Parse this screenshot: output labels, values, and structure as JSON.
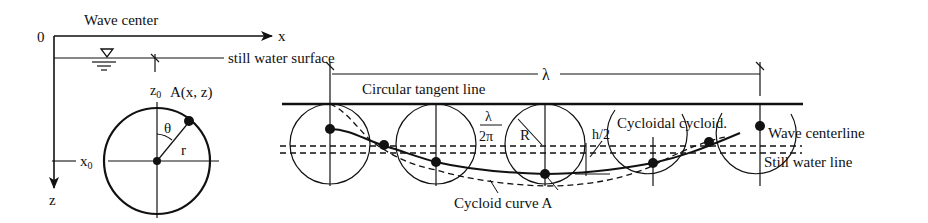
{
  "left_panel": {
    "origin_label": "0",
    "title": "Wave center",
    "x_axis_label": "x",
    "z_axis_label": "z",
    "surface_label": "still water surface",
    "z0_label": "z",
    "z0_sub": "0",
    "x0_label": "x",
    "x0_sub": "0",
    "point_label": "A(x, z)",
    "theta_label": "θ",
    "radius_label": "r"
  },
  "right_panel": {
    "wavelength_label": "λ",
    "tangent_line_label": "Circular tangent line",
    "radius_fraction_num": "λ",
    "radius_fraction_den": "2π",
    "radius_label": "R",
    "half_height_label": "h/2",
    "cycloid_label": "Cycloidal cycloid.",
    "centerline_label": "Wave centerline",
    "still_water_label": "Still water line",
    "cycloid_curve_label": "Cycloid curve A"
  },
  "colors": {
    "ink": "#111111",
    "background": "#ffffff"
  }
}
